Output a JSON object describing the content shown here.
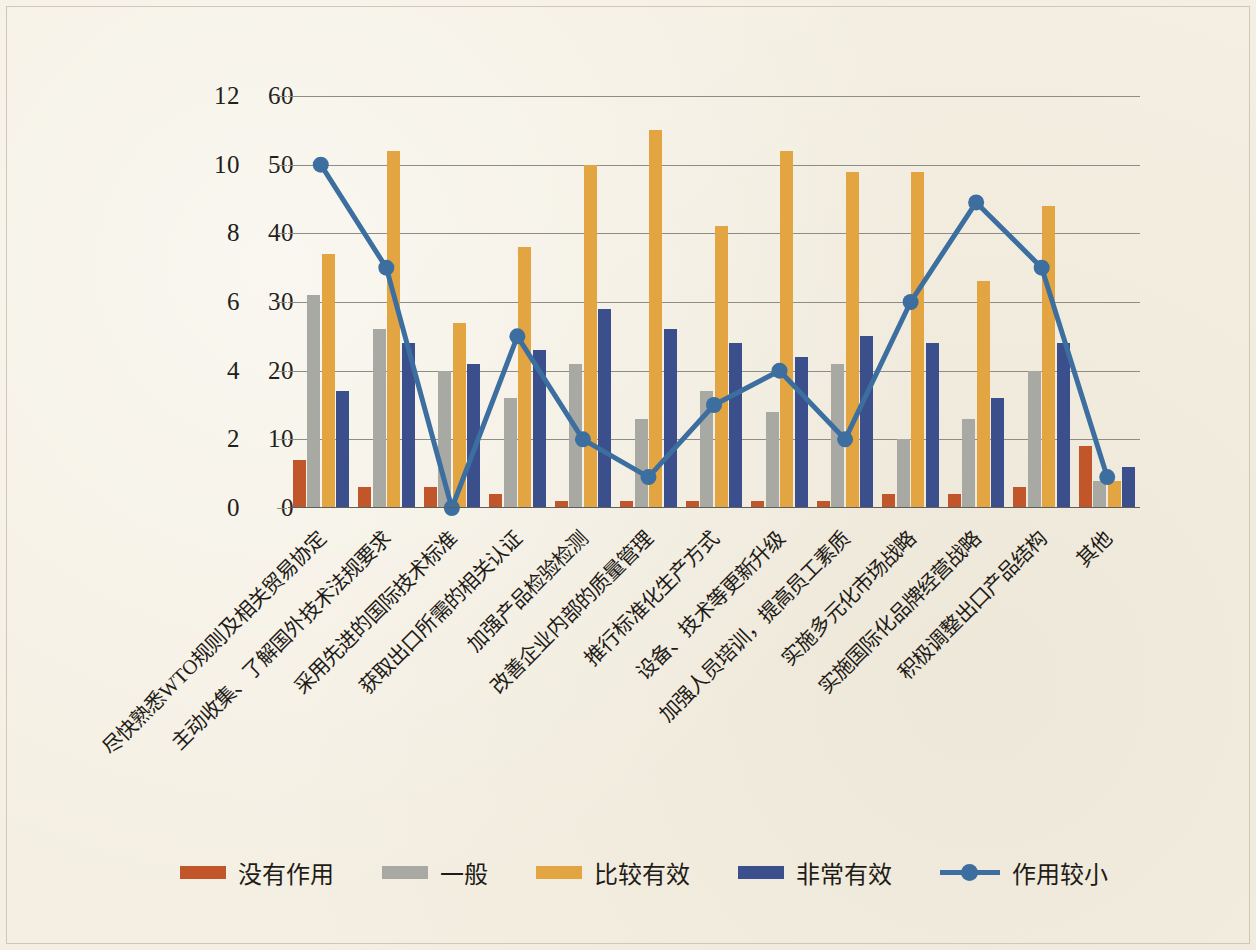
{
  "chart_data": {
    "type": "bar",
    "title": "",
    "xlabel": "",
    "ylabel": "",
    "grid": true,
    "legend_position": "bottom",
    "axes": {
      "left": {
        "ticks": [
          "0",
          "2",
          "4",
          "6",
          "8",
          "10",
          "12"
        ],
        "min": 0,
        "max": 12
      },
      "right": {
        "ticks": [
          "0",
          "10",
          "20",
          "30",
          "40",
          "50",
          "60"
        ],
        "min": 0,
        "max": 60
      }
    },
    "categories": [
      "尽快熟悉WTO规则及相关贸易协定",
      "主动收集、了解国外技术法规要求",
      "采用先进的国际技术标准",
      "获取出口所需的相关认证",
      "加强产品检验检测",
      "改善企业内部的质量管理",
      "推行标准化生产方式",
      "设备、技术等更新升级",
      "加强人员培训，提高员工素质",
      "实施多元化市场战略",
      "实施国际化品牌经营战略",
      "积极调整出口产品结构",
      "其他"
    ],
    "series": [
      {
        "name": "没有作用",
        "axis": "right",
        "color": "#c2562b",
        "kind": "bar",
        "values": [
          7,
          3,
          3,
          2,
          1,
          1,
          1,
          1,
          1,
          2,
          2,
          3,
          9
        ]
      },
      {
        "name": "一般",
        "axis": "right",
        "color": "#a9a9a4",
        "kind": "bar",
        "values": [
          31,
          26,
          20,
          16,
          21,
          13,
          17,
          14,
          21,
          10,
          13,
          20,
          4
        ]
      },
      {
        "name": "比较有效",
        "axis": "right",
        "color": "#e3a442",
        "kind": "bar",
        "values": [
          37,
          52,
          27,
          38,
          50,
          55,
          41,
          52,
          49,
          49,
          33,
          44,
          4
        ]
      },
      {
        "name": "非常有效",
        "axis": "right",
        "color": "#3a4f8b",
        "kind": "bar",
        "values": [
          17,
          24,
          21,
          23,
          29,
          26,
          24,
          22,
          25,
          24,
          16,
          24,
          6
        ]
      },
      {
        "name": "作用较小",
        "axis": "left",
        "color": "#3c6e9f",
        "kind": "line",
        "values": [
          10,
          7,
          0,
          5,
          2,
          0.9,
          3,
          4,
          2,
          6,
          8.9,
          7,
          0.9
        ]
      }
    ]
  },
  "legend": {
    "items": [
      {
        "label": "没有作用",
        "style": "bar",
        "class": "s0"
      },
      {
        "label": "一般",
        "style": "bar",
        "class": "s1"
      },
      {
        "label": "比较有效",
        "style": "bar",
        "class": "s2"
      },
      {
        "label": "非常有效",
        "style": "bar",
        "class": "s3"
      },
      {
        "label": "作用较小",
        "style": "line",
        "class": "line"
      }
    ]
  }
}
